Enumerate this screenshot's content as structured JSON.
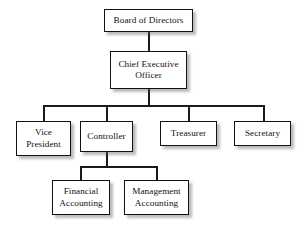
{
  "diagram": {
    "type": "organizational-hierarchy",
    "background_color": "#ffffff",
    "box_border_color": "#111111",
    "box_fill_color": "#ffffff",
    "connector_color": "#1a1a1a",
    "text_color": "#111111"
  },
  "nodes": {
    "board": {
      "label": "Board of Directors",
      "level": 1
    },
    "ceo": {
      "label": "Chief Executive\nOfficer",
      "level": 2
    },
    "vice_president": {
      "label": "Vice\nPresident",
      "level": 3
    },
    "controller": {
      "label": "Controller",
      "level": 3
    },
    "treasurer": {
      "label": "Treasurer",
      "level": 3
    },
    "secretary": {
      "label": "Secretary",
      "level": 3
    },
    "financial_accounting": {
      "label": "Financial\nAccounting",
      "level": 4
    },
    "management_accounting": {
      "label": "Management\nAccounting",
      "level": 4
    }
  },
  "edges": [
    {
      "from": "board",
      "to": "ceo"
    },
    {
      "from": "ceo",
      "to": "vice_president"
    },
    {
      "from": "ceo",
      "to": "controller"
    },
    {
      "from": "ceo",
      "to": "treasurer"
    },
    {
      "from": "ceo",
      "to": "secretary"
    },
    {
      "from": "controller",
      "to": "financial_accounting"
    },
    {
      "from": "controller",
      "to": "management_accounting"
    }
  ]
}
